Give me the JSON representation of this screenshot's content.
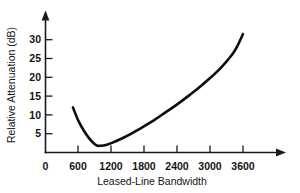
{
  "chart_data": {
    "type": "line",
    "title": "",
    "xlabel": "Leased-Line Bandwidth",
    "ylabel": "Relative Attenuation (dB)",
    "xlim": [
      0,
      4000
    ],
    "ylim": [
      0,
      35
    ],
    "grid": false,
    "legend": "none",
    "x_ticks": [
      0,
      600,
      1200,
      1800,
      2400,
      3000,
      3600
    ],
    "x_tick_labels": [
      "0",
      "600",
      "1200",
      "1800",
      "2400",
      "3000",
      "3600"
    ],
    "y_ticks": [
      5,
      10,
      15,
      20,
      25,
      30
    ],
    "y_tick_labels": [
      "5",
      "10",
      "15",
      "20",
      "25",
      "30"
    ],
    "series": [
      {
        "name": "Relative Attenuation",
        "x": [
          500,
          600,
          700,
          800,
          900,
          950,
          1000,
          1100,
          1200,
          1400,
          1600,
          1800,
          2000,
          2200,
          2400,
          2600,
          2800,
          3000,
          3200,
          3400,
          3500,
          3600
        ],
        "y": [
          12.0,
          8.4,
          5.8,
          3.7,
          2.2,
          1.8,
          1.8,
          2.0,
          2.5,
          3.8,
          5.3,
          7.0,
          8.8,
          10.8,
          12.8,
          15.0,
          17.3,
          19.8,
          22.6,
          26.0,
          28.4,
          31.5
        ]
      }
    ],
    "curve_points": {
      "start": {
        "x": 500,
        "y": 12.0
      },
      "minimum": {
        "x": 950,
        "y": 1.8
      },
      "end": {
        "x": 3600,
        "y": 31.5
      }
    },
    "colors": {
      "curve": "#0d0d0d",
      "axis": "#1a1a1a",
      "text": "#141414",
      "background": "#ffffff"
    }
  },
  "axes": {
    "y_axis_name": "relative-attenuation-axis",
    "x_axis_name": "leased-line-bandwidth-axis"
  }
}
